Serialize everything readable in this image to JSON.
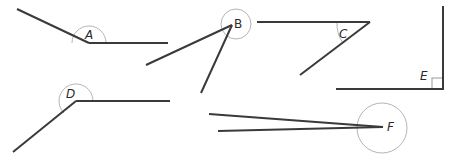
{
  "diagram": {
    "title": "",
    "angles": [
      {
        "id": "A",
        "label": "A",
        "vertex": [
          89,
          43
        ],
        "rays": [
          [
            17,
            9
          ],
          [
            168,
            43
          ]
        ],
        "type": "obtuse"
      },
      {
        "id": "B",
        "label": "B",
        "vertex": [
          232,
          25
        ],
        "rays": [
          [
            146,
            65
          ],
          [
            201,
            93
          ]
        ],
        "type": "acute"
      },
      {
        "id": "C",
        "label": "C",
        "vertex": [
          370,
          22
        ],
        "rays": [
          [
            257,
            22
          ],
          [
            300,
            75
          ]
        ],
        "type": "acute"
      },
      {
        "id": "D",
        "label": "D",
        "vertex": [
          76,
          101
        ],
        "rays": [
          [
            170,
            101
          ],
          [
            13,
            152
          ]
        ],
        "type": "obtuse"
      },
      {
        "id": "E",
        "label": "E",
        "vertex": [
          443,
          89
        ],
        "rays": [
          [
            443,
            6
          ],
          [
            336,
            89
          ]
        ],
        "type": "right"
      },
      {
        "id": "F",
        "label": "F",
        "vertex": [
          383,
          126
        ],
        "rays": [
          [
            209,
            114
          ],
          [
            218,
            131
          ]
        ],
        "type": "acute"
      }
    ]
  },
  "colors": {
    "ray": "#3a3a3a",
    "arc": "#b5b5b5",
    "label": "#2a2a2a",
    "background": "#ffffff"
  }
}
